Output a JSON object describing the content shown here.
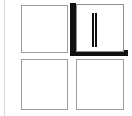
{
  "canvas": {
    "width": 132,
    "height": 116,
    "background_color": "#ffffff"
  },
  "palette": {
    "tile_border": "#9c9c9c",
    "tile_fill": "#ffffff",
    "shadow": "#111111",
    "rule": "#d8d8d8",
    "bar_stroke": "#111111"
  },
  "layout": {
    "kind": "2x2-tile-grid",
    "rows": 2,
    "columns": 2,
    "label": ""
  },
  "tiles": [
    {
      "id": "tile-top-left",
      "position": "top-left",
      "label": "",
      "selected": false,
      "has_shadow": false,
      "content": "empty"
    },
    {
      "id": "tile-top-right",
      "position": "top-right",
      "label": "",
      "selected": true,
      "has_shadow": true,
      "content": "vertical-bar"
    },
    {
      "id": "tile-bottom-left",
      "position": "bottom-left",
      "label": "",
      "selected": false,
      "has_shadow": false,
      "content": "empty"
    },
    {
      "id": "tile-bottom-right",
      "position": "bottom-right",
      "label": "",
      "selected": false,
      "has_shadow": false,
      "content": "empty"
    }
  ],
  "decorations": {
    "left_rule": {
      "visible": true,
      "color": "#d8d8d8"
    }
  }
}
